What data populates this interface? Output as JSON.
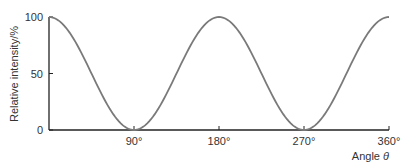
{
  "chart_data": {
    "type": "line",
    "title": "",
    "xlabel": "Angle θ",
    "ylabel": "Relative intensity/%",
    "xlim": [
      0,
      360
    ],
    "ylim": [
      0,
      100
    ],
    "x_ticks": [
      90,
      180,
      270,
      360
    ],
    "x_tick_labels": [
      "90°",
      "180°",
      "270°",
      "360°"
    ],
    "y_ticks": [
      0,
      50,
      100
    ],
    "y_tick_labels": [
      "0",
      "50",
      "100"
    ],
    "grid": false,
    "legend": null,
    "series": [
      {
        "name": "Relative intensity (cos²θ)",
        "x": [
          0,
          15,
          30,
          45,
          60,
          75,
          90,
          105,
          120,
          135,
          150,
          165,
          180,
          195,
          210,
          225,
          240,
          255,
          270,
          285,
          300,
          315,
          330,
          345,
          360
        ],
        "values": [
          100,
          93.3,
          75,
          50,
          25,
          6.7,
          0,
          6.7,
          25,
          50,
          75,
          93.3,
          100,
          93.3,
          75,
          50,
          25,
          6.7,
          0,
          6.7,
          25,
          50,
          75,
          93.3,
          100
        ],
        "color": "#7a7a7a"
      }
    ]
  }
}
